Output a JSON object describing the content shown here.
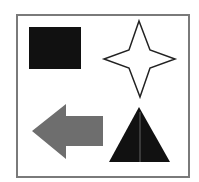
{
  "figure": {
    "width": 199,
    "height": 182,
    "background": "#ffffff",
    "frame": {
      "x": 17,
      "y": 15,
      "w": 172,
      "h": 162,
      "stroke": "#7a7a7a",
      "stroke_width": 2
    },
    "shapes": [
      {
        "name": "square",
        "kind": "rect",
        "fill": "#111111",
        "x": 29,
        "y": 27,
        "w": 52,
        "h": 42
      },
      {
        "name": "four-point-star",
        "kind": "polygon",
        "fill": "#ffffff",
        "stroke": "#222222",
        "points": "139,21 150,50 175,59 150,68 140,97 129,68 104,59 129,50"
      },
      {
        "name": "left-arrow",
        "kind": "polygon",
        "fill": "#6e6e6e",
        "points": "32,131 66,104 66,116 103,116 103,146 66,146 66,159"
      },
      {
        "name": "triangle",
        "kind": "polygon",
        "fill": "#111111",
        "points": "139,107 170,162 109,162"
      }
    ]
  }
}
